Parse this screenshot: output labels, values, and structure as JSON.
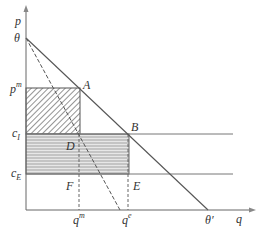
{
  "diagram": {
    "type": "monopoly-vs-efficiency price-quantity diagram",
    "axes": {
      "y_label": "p",
      "x_label": "q"
    },
    "price_levels": [
      {
        "id": "theta",
        "label": "θ"
      },
      {
        "id": "pm",
        "label": "p",
        "sup": "m"
      },
      {
        "id": "cI",
        "label": "c",
        "sub": "I"
      },
      {
        "id": "cE",
        "label": "c",
        "sub": "E"
      }
    ],
    "quantity_levels": [
      {
        "id": "qm",
        "label": "q",
        "sup": "m"
      },
      {
        "id": "qe",
        "label": "q",
        "sup": "e"
      },
      {
        "id": "theta_prime",
        "label": "θ′"
      }
    ],
    "points": {
      "A": "A",
      "B": "B",
      "D": "D",
      "E": "E",
      "F": "F"
    },
    "regions": [
      {
        "id": "monopoly-profit",
        "style": "diagonal hatch",
        "bounds": "p^m to c_I, 0 to q^m"
      },
      {
        "id": "cost-saving",
        "style": "horizontal hatch gray",
        "bounds": "c_I to c_E, 0 to q^e"
      }
    ],
    "lines": [
      {
        "id": "demand",
        "style": "solid",
        "from": "θ",
        "to": "θ′"
      },
      {
        "id": "marginal-revenue",
        "style": "dashed",
        "from": "θ"
      }
    ],
    "colors": {
      "line": "#555555",
      "gray_fill": "#b8b8b8",
      "hatch": "#666666"
    }
  }
}
